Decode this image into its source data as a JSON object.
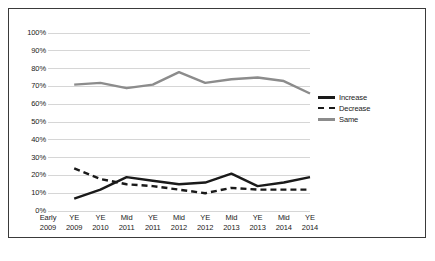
{
  "chart_data": {
    "type": "line",
    "title": "",
    "xlabel": "",
    "ylabel": "",
    "ylim": [
      0,
      100
    ],
    "ytick_labels": [
      "100%",
      "90%",
      "80%",
      "70%",
      "60%",
      "50%",
      "40%",
      "30%",
      "20%",
      "10%",
      "0%"
    ],
    "ytick_values": [
      100,
      90,
      80,
      70,
      60,
      50,
      40,
      30,
      20,
      10,
      0
    ],
    "grid": true,
    "legend_position": "right",
    "categories": [
      "Early 2009",
      "YE 2009",
      "YE 2010",
      "Mid 2011",
      "YE 2011",
      "Mid 2012",
      "YE 2012",
      "Mid 2013",
      "YE 2013",
      "Mid 2014",
      "YE 2014"
    ],
    "category_lines": [
      [
        "Early",
        "2009"
      ],
      [
        "YE",
        "2009"
      ],
      [
        "YE",
        "2010"
      ],
      [
        "Mid",
        "2011"
      ],
      [
        "YE",
        "2011"
      ],
      [
        "Mid",
        "2012"
      ],
      [
        "YE",
        "2012"
      ],
      [
        "Mid",
        "2013"
      ],
      [
        "YE",
        "2013"
      ],
      [
        "Mid",
        "2014"
      ],
      [
        "YE",
        "2014"
      ]
    ],
    "series": [
      {
        "name": "Increase",
        "color": "#1a1a1a",
        "style": "solid",
        "values": [
          null,
          7,
          12,
          19,
          17,
          15,
          16,
          21,
          14,
          16,
          19
        ]
      },
      {
        "name": "Decrease",
        "color": "#1a1a1a",
        "style": "dashed",
        "values": [
          null,
          24,
          18,
          15,
          14,
          12,
          10,
          13,
          12,
          12,
          12
        ]
      },
      {
        "name": "Same",
        "color": "#8c8c8c",
        "style": "solid",
        "values": [
          null,
          71,
          72,
          69,
          71,
          78,
          72,
          74,
          75,
          73,
          66
        ]
      }
    ]
  },
  "legend": {
    "items": [
      {
        "label": "Increase",
        "swatch": "solid-black-line-icon"
      },
      {
        "label": "Decrease",
        "swatch": "dashed-black-line-icon"
      },
      {
        "label": "Same",
        "swatch": "solid-gray-line-icon"
      }
    ]
  }
}
